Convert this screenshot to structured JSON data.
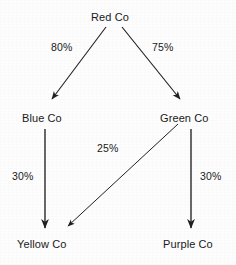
{
  "diagram": {
    "background_color": "#fdfdfd",
    "line_color": "#231f20",
    "text_color": "#1a1a1a",
    "nodes": [
      {
        "id": "red",
        "label": "Red Co",
        "x": 91,
        "y": 11
      },
      {
        "id": "blue",
        "label": "Blue Co",
        "x": 22,
        "y": 112
      },
      {
        "id": "green",
        "label": "Green Co",
        "x": 160,
        "y": 112
      },
      {
        "id": "yellow",
        "label": "Yellow Co",
        "x": 17,
        "y": 238
      },
      {
        "id": "purple",
        "label": "Purple Co",
        "x": 163,
        "y": 238
      }
    ],
    "edges": [
      {
        "id": "red-blue",
        "from": "Red Co",
        "to": "Blue Co",
        "label": "80%",
        "style": "solid-arrow"
      },
      {
        "id": "red-green",
        "from": "Red Co",
        "to": "Green Co",
        "label": "75%",
        "style": "solid-arrow"
      },
      {
        "id": "blue-yellow",
        "from": "Blue Co",
        "to": "Yellow Co",
        "label": "30%",
        "style": "solid-arrow"
      },
      {
        "id": "green-yellow",
        "from": "Green Co",
        "to": "Yellow Co",
        "label": "25%",
        "style": "solid-arrow"
      },
      {
        "id": "green-purple",
        "from": "Green Co",
        "to": "Purple Co",
        "label": "30%",
        "style": "solid-arrow"
      }
    ]
  }
}
